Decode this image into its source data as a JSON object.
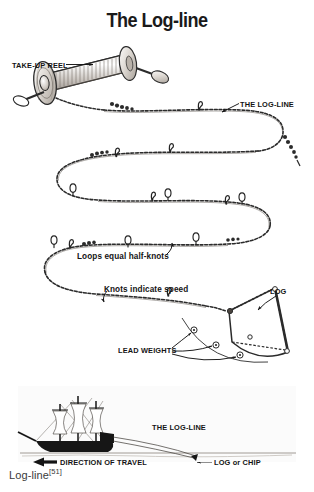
{
  "page": {
    "title": "The Log-line",
    "background_color": "#ffffff",
    "ink_color": "#111111",
    "caption": "Log-line",
    "caption_reference": "[51]"
  },
  "labels": {
    "take_up_reel": "TAKE-UP REEL",
    "the_log_line_top": "THE LOG-LINE",
    "loops_equal_half_knots": "Loops equal half-knots",
    "knots_indicate_speed": "Knots indicate speed",
    "log": "LOG",
    "lead_weights": "LEAD WEIGHTS",
    "the_log_line_ship": "THE LOG-LINE",
    "direction_of_travel": "DIRECTION OF TRAVEL",
    "log_or_chip": "LOG or CHIP"
  },
  "illustration": {
    "take_up_reel": "wooden-spool-with-coiled-line",
    "log_line_rope": "serpentine-twisted-rope-with-knots-and-loops",
    "log_chip": "triangular-wooden-log-chip",
    "lead_weights_count": 3,
    "ship": "three-masted-sailing-ship-silhouette",
    "waterline": "sea-surface-line"
  }
}
